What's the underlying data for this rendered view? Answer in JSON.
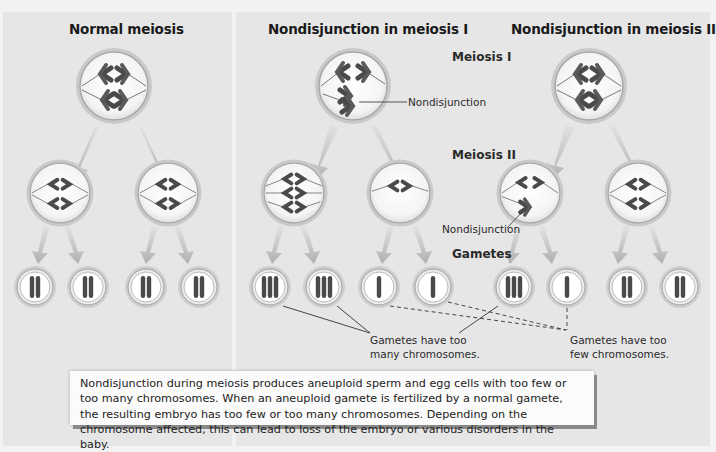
{
  "panels": {
    "normal": {
      "title": "Normal meiosis"
    },
    "nd1": {
      "title": "Nondisjunction in meiosis I"
    },
    "nd2": {
      "title": "Nondisjunction in meiosis II"
    }
  },
  "stages": {
    "meiosis1": "Meiosis I",
    "meiosis2": "Meiosis II",
    "gametes": "Gametes"
  },
  "callouts": {
    "nondisjunction_1": "Nondisjunction",
    "nondisjunction_2": "Nondisjunction",
    "too_many_line1": "Gametes have too",
    "too_many_line2": "many chromosomes.",
    "too_few_line1": "Gametes have too",
    "too_few_line2": "few chromosomes."
  },
  "gametes": {
    "normal": [
      2,
      2,
      2,
      2
    ],
    "nd1": [
      3,
      3,
      1,
      1
    ],
    "nd2": [
      3,
      1,
      2,
      2
    ]
  },
  "caption": {
    "text": "Nondisjunction during meiosis produces aneuploid sperm and egg cells with too few or too many chromosomes. When an aneuploid gamete is fertilized by a normal gamete, the resulting embryo has too few or too many chromosomes. Depending on the chromosome affected, this can lead to loss of the embryo or various disorders in the baby."
  },
  "colors": {
    "background": "#f2f2f2",
    "panel": "#e6e6e6",
    "chromosome": "#4a4a4a",
    "cell_ring": "#b8b8b8",
    "arrow": "#c4c4c4"
  }
}
